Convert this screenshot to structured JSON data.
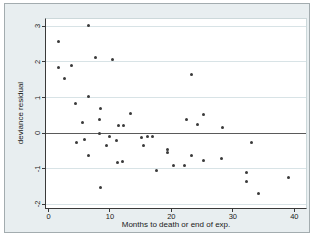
{
  "figure": {
    "background_color": "#e8eef0",
    "plot_background_color": "#ffffff",
    "border_color": "#a3acaf"
  },
  "chart_data": {
    "type": "scatter",
    "title": "",
    "xlabel": "Months to death or end of exp.",
    "ylabel": "deviance residual",
    "xlim": [
      -0.4,
      41.9
    ],
    "ylim": [
      -2.11,
      3.21
    ],
    "xticks": [
      0,
      10,
      20,
      30,
      40
    ],
    "yticks": [
      -2,
      -1,
      0,
      1,
      2,
      3
    ],
    "grid": "horizontal",
    "legend": "none",
    "reference_line_y": 0,
    "marker_color": "#3a3a3a",
    "grid_color": "#d8e3e6",
    "zero_line_color": "#5a5a5a",
    "points": [
      [
        6.5,
        3.02
      ],
      [
        1.6,
        2.57
      ],
      [
        7.6,
        2.13
      ],
      [
        10.5,
        2.06
      ],
      [
        1.7,
        1.85
      ],
      [
        3.7,
        1.9
      ],
      [
        2.6,
        1.54
      ],
      [
        23.3,
        1.66
      ],
      [
        6.5,
        1.03
      ],
      [
        4.4,
        0.84
      ],
      [
        8.4,
        0.7
      ],
      [
        13.3,
        0.56
      ],
      [
        5.6,
        0.31
      ],
      [
        8.3,
        0.38
      ],
      [
        11.4,
        0.22
      ],
      [
        12.2,
        0.22
      ],
      [
        8.3,
        0.0
      ],
      [
        22.4,
        0.37
      ],
      [
        25.3,
        0.52
      ],
      [
        24.3,
        0.25
      ],
      [
        28.3,
        0.16
      ],
      [
        4.5,
        -0.28
      ],
      [
        5.8,
        -0.17
      ],
      [
        10.0,
        -0.11
      ],
      [
        11.1,
        -0.21
      ],
      [
        9.5,
        -0.34
      ],
      [
        6.5,
        -0.62
      ],
      [
        15.2,
        -0.12
      ],
      [
        16.1,
        -0.1
      ],
      [
        16.9,
        -0.1
      ],
      [
        15.4,
        -0.34
      ],
      [
        19.3,
        -0.45
      ],
      [
        19.4,
        -0.55
      ],
      [
        11.2,
        -0.82
      ],
      [
        12.1,
        -0.81
      ],
      [
        17.5,
        -1.05
      ],
      [
        8.4,
        -1.53
      ],
      [
        33.1,
        -0.27
      ],
      [
        23.2,
        -0.62
      ],
      [
        25.2,
        -0.77
      ],
      [
        28.2,
        -0.73
      ],
      [
        20.3,
        -0.9
      ],
      [
        22.1,
        -0.92
      ],
      [
        32.2,
        -1.12
      ],
      [
        32.3,
        -1.37
      ],
      [
        34.2,
        -1.7
      ],
      [
        39.0,
        -1.26
      ]
    ]
  }
}
